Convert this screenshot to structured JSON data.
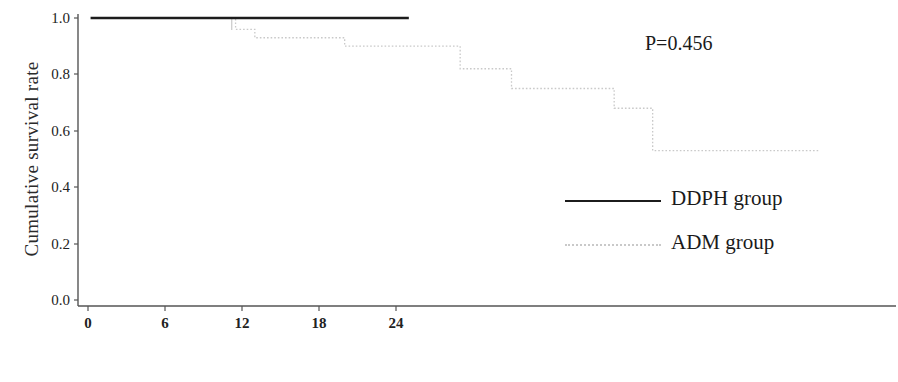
{
  "chart_data": {
    "type": "line",
    "title": "",
    "subtitle": "",
    "xlabel": "Time since start of therapy (months)",
    "ylabel": "Cumulative survival rate",
    "xlim": [
      0,
      57
    ],
    "ylim": [
      0.0,
      1.0
    ],
    "xticks": [
      0,
      6,
      12,
      18,
      24
    ],
    "xtick_labels": [
      "0",
      "6",
      "12",
      "18",
      "24"
    ],
    "yticks": [
      0.0,
      0.2,
      0.4,
      0.6,
      0.8,
      1.0
    ],
    "ytick_labels": [
      "0.0",
      "0.2",
      "0.4",
      "0.6",
      "0.8",
      "1.0"
    ],
    "grid": false,
    "legend_position": "center-right",
    "annotations": [
      {
        "text": "P=0.456",
        "x": 44,
        "y": 0.93
      }
    ],
    "series": [
      {
        "name": "DDPH group",
        "style": "solid",
        "color": "#1c1c1c",
        "x": [
          0.2,
          25.0
        ],
        "y": [
          1.0,
          1.0
        ],
        "steps": [
          {
            "time": 0.2,
            "survival": 1.0
          },
          {
            "time": 25.0,
            "survival": 1.0
          }
        ],
        "censor_marks": []
      },
      {
        "name": "ADM group",
        "style": "dotted",
        "color": "#c9c9c9",
        "x": [
          11.0,
          11.5,
          13.0,
          20.0,
          29.0,
          33.0,
          41.0,
          44.0,
          57.0
        ],
        "y": [
          1.0,
          0.96,
          0.93,
          0.9,
          0.82,
          0.75,
          0.68,
          0.53,
          0.53
        ],
        "steps": [
          {
            "time": 11.0,
            "survival": 1.0
          },
          {
            "time": 11.5,
            "survival": 0.96
          },
          {
            "time": 13.0,
            "survival": 0.93
          },
          {
            "time": 20.0,
            "survival": 0.9
          },
          {
            "time": 29.0,
            "survival": 0.82
          },
          {
            "time": 33.0,
            "survival": 0.75
          },
          {
            "time": 41.0,
            "survival": 0.68
          },
          {
            "time": 44.0,
            "survival": 0.53
          },
          {
            "time": 57.0,
            "survival": 0.53
          }
        ],
        "censor_marks": [
          11.2
        ]
      }
    ]
  },
  "legend": {
    "items": [
      {
        "label": "DDPH group",
        "style": "solid"
      },
      {
        "label": "ADM group",
        "style": "dotted"
      }
    ]
  },
  "annotation": {
    "p_value_text": "P=0.456"
  },
  "axes": {
    "y_title": "Cumulative survival rate",
    "x_title": "Time since start of therapy (months)"
  }
}
